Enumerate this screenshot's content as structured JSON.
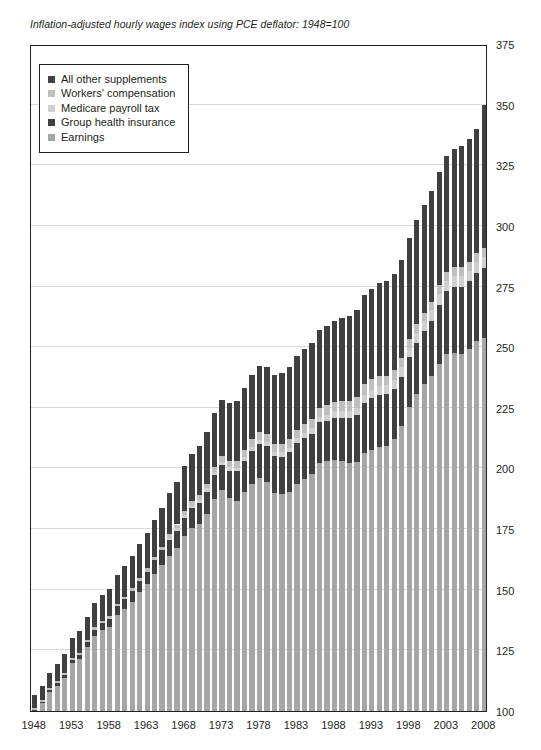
{
  "chart_data": {
    "type": "bar",
    "subtype": "stacked-bar",
    "title": "Inflation-adjusted hourly wages index using PCE deflator: 1948=100",
    "xlabel": "",
    "ylabel": "",
    "ylim": [
      100,
      375
    ],
    "ytick_step": 25,
    "yticks": [
      100,
      125,
      150,
      175,
      200,
      225,
      250,
      275,
      300,
      325,
      350,
      375
    ],
    "grid": true,
    "grid_axis": "y",
    "legend_position": "top-left-inside",
    "baseline": 100,
    "x": [
      1948,
      1949,
      1950,
      1951,
      1952,
      1953,
      1954,
      1955,
      1956,
      1957,
      1958,
      1959,
      1960,
      1961,
      1962,
      1963,
      1964,
      1965,
      1966,
      1967,
      1968,
      1969,
      1970,
      1971,
      1972,
      1973,
      1974,
      1975,
      1976,
      1977,
      1978,
      1979,
      1980,
      1981,
      1982,
      1983,
      1984,
      1985,
      1986,
      1987,
      1988,
      1989,
      1990,
      1991,
      1992,
      1993,
      1994,
      1995,
      1996,
      1997,
      1998,
      1999,
      2000,
      2001,
      2002,
      2003,
      2004,
      2005,
      2006,
      2007,
      2008
    ],
    "xtick_labels": [
      1948,
      1953,
      1958,
      1963,
      1968,
      1973,
      1978,
      1983,
      1988,
      1993,
      1998,
      2003,
      2008
    ],
    "series": [
      {
        "name": "Earnings",
        "color": "#a6a6a6",
        "values": [
          100.0,
          103.2,
          107.8,
          110.5,
          113.8,
          119.6,
          121.4,
          126.3,
          131.0,
          133.4,
          134.8,
          139.5,
          142.0,
          145.1,
          148.9,
          152.3,
          156.6,
          160.2,
          164.1,
          167.4,
          172.3,
          175.6,
          177.3,
          181.2,
          187.4,
          191.0,
          187.9,
          186.7,
          190.3,
          193.8,
          196.0,
          194.5,
          189.9,
          189.4,
          190.3,
          193.5,
          195.6,
          197.6,
          202.4,
          203.0,
          203.6,
          203.2,
          202.3,
          202.6,
          206.4,
          207.6,
          208.7,
          209.4,
          212.2,
          217.6,
          225.4,
          230.9,
          234.9,
          238.1,
          243.0,
          247.0,
          247.7,
          247.3,
          249.4,
          252.5,
          253.9
        ]
      },
      {
        "name": "Group health insurance",
        "color": "#404040",
        "values": [
          0.5,
          0.6,
          0.8,
          1.0,
          1.2,
          1.5,
          1.8,
          2.1,
          2.5,
          2.9,
          3.2,
          3.6,
          4.0,
          4.4,
          4.8,
          5.2,
          5.6,
          6.0,
          6.4,
          6.9,
          7.4,
          8.0,
          8.6,
          9.3,
          9.9,
          10.4,
          11.2,
          12.1,
          12.8,
          13.6,
          14.2,
          14.6,
          15.1,
          15.5,
          16.4,
          17.0,
          17.1,
          16.8,
          16.6,
          16.7,
          17.2,
          17.7,
          18.4,
          19.4,
          20.6,
          21.3,
          21.5,
          21.1,
          20.6,
          20.3,
          20.4,
          20.9,
          21.6,
          22.9,
          24.6,
          26.2,
          27.2,
          27.6,
          27.8,
          28.2,
          28.7
        ]
      },
      {
        "name": "Medicare payroll tax",
        "color": "#d0d0d0",
        "values": [
          0.0,
          0.0,
          0.0,
          0.0,
          0.0,
          0.0,
          0.0,
          0.0,
          0.0,
          0.0,
          0.0,
          0.0,
          0.0,
          0.0,
          0.0,
          0.0,
          0.0,
          0.0,
          0.9,
          1.0,
          1.1,
          1.1,
          1.2,
          1.3,
          1.3,
          1.4,
          1.5,
          1.5,
          1.6,
          1.6,
          1.7,
          1.7,
          1.7,
          1.8,
          1.9,
          2.0,
          2.1,
          2.2,
          2.3,
          2.4,
          2.7,
          2.8,
          2.9,
          3.0,
          3.2,
          3.3,
          3.7,
          3.8,
          3.8,
          3.9,
          4.0,
          4.1,
          4.2,
          4.2,
          4.2,
          4.2,
          4.3,
          4.3,
          4.4,
          4.4,
          4.4
        ]
      },
      {
        "name": "Workers' compensation",
        "color": "#bfbfbf",
        "values": [
          0.6,
          0.6,
          0.7,
          0.7,
          0.8,
          0.8,
          0.9,
          0.9,
          1.0,
          1.0,
          1.1,
          1.1,
          1.2,
          1.2,
          1.3,
          1.3,
          1.4,
          1.5,
          1.5,
          1.6,
          1.7,
          1.8,
          1.9,
          2.0,
          2.1,
          2.3,
          2.4,
          2.6,
          2.8,
          3.0,
          3.2,
          3.3,
          3.4,
          3.5,
          3.6,
          3.5,
          3.5,
          3.6,
          3.7,
          3.9,
          4.0,
          4.1,
          4.3,
          4.5,
          4.6,
          4.5,
          4.3,
          4.0,
          3.8,
          3.6,
          3.5,
          3.5,
          3.5,
          3.6,
          3.7,
          3.8,
          3.8,
          3.8,
          3.7,
          3.7,
          3.7
        ]
      },
      {
        "name": "All other supplements",
        "color": "#404040",
        "values": [
          5.5,
          5.9,
          6.4,
          7.0,
          7.6,
          8.2,
          8.8,
          9.4,
          10.1,
          10.7,
          11.3,
          12.0,
          12.6,
          13.2,
          13.9,
          14.6,
          15.3,
          16.0,
          16.8,
          17.6,
          18.5,
          19.4,
          20.3,
          21.3,
          22.3,
          23.1,
          24.0,
          24.9,
          25.7,
          26.5,
          27.3,
          27.9,
          28.4,
          29.0,
          29.8,
          30.5,
          31.0,
          31.5,
          32.1,
          32.6,
          33.3,
          34.1,
          34.9,
          35.8,
          36.8,
          37.5,
          38.2,
          38.9,
          39.7,
          40.7,
          41.8,
          43.0,
          44.3,
          45.4,
          46.6,
          47.8,
          48.9,
          49.8,
          50.6,
          51.3,
          59.3
        ]
      }
    ],
    "legend_entries": [
      {
        "label": "All other supplements",
        "color": "#404040"
      },
      {
        "label": "Workers' compensation",
        "color": "#bfbfbf"
      },
      {
        "label": "Medicare payroll tax",
        "color": "#d0d0d0"
      },
      {
        "label": "Group health insurance",
        "color": "#404040"
      },
      {
        "label": "Earnings",
        "color": "#a6a6a6"
      }
    ]
  }
}
